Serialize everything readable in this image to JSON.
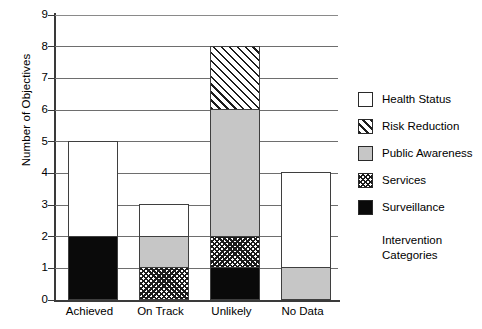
{
  "chart_data": {
    "type": "bar",
    "subtype": "stacked-bar",
    "title": "",
    "xlabel": "",
    "ylabel": "Number of Objectives",
    "ylim": [
      0,
      9
    ],
    "ytick_step": 1,
    "yticks": [
      "9",
      "8",
      "7",
      "6",
      "5",
      "4",
      "3",
      "2",
      "1",
      "0"
    ],
    "grid": true,
    "legend_position": "right",
    "legend_title_lines": [
      "Intervention",
      "Categories"
    ],
    "categories": [
      "Achieved",
      "On Track",
      "Unlikely",
      "No Data"
    ],
    "series": [
      {
        "name": "Surveillance",
        "pattern": "solid-black",
        "color": "#0a0a0a",
        "values": [
          2,
          0,
          1,
          0
        ]
      },
      {
        "name": "Services",
        "pattern": "crosshatch",
        "color": "#ffffff",
        "values": [
          0,
          1,
          1,
          0
        ]
      },
      {
        "name": "Public Awareness",
        "pattern": "solid-gray",
        "color": "#c6c6c6",
        "values": [
          0,
          1,
          4,
          1
        ]
      },
      {
        "name": "Risk Reduction",
        "pattern": "diagonal-hatch",
        "color": "#ffffff",
        "values": [
          0,
          0,
          2,
          0
        ]
      },
      {
        "name": "Health Status",
        "pattern": "solid-white",
        "color": "#ffffff",
        "values": [
          3,
          1,
          0,
          3
        ]
      }
    ],
    "totals": [
      5,
      3,
      8,
      4
    ],
    "stack_order_bottom_to_top": [
      "Surveillance",
      "Services",
      "Public Awareness",
      "Risk Reduction",
      "Health Status"
    ]
  },
  "legend": {
    "entries": [
      {
        "label": "Health Status",
        "pattern": "solid-white"
      },
      {
        "label": "Risk Reduction",
        "pattern": "diagonal-hatch"
      },
      {
        "label": "Public Awareness",
        "pattern": "solid-gray"
      },
      {
        "label": "Services",
        "pattern": "crosshatch"
      },
      {
        "label": "Surveillance",
        "pattern": "solid-black"
      }
    ],
    "title_line1": "Intervention",
    "title_line2": "Categories"
  },
  "axes": {
    "y_title": "Number of Objectives",
    "y_tick_labels": [
      "9",
      "8",
      "7",
      "6",
      "5",
      "4",
      "3",
      "2",
      "1",
      "0"
    ],
    "x_tick_labels": [
      "Achieved",
      "On Track",
      "Unlikely",
      "No Data"
    ]
  }
}
